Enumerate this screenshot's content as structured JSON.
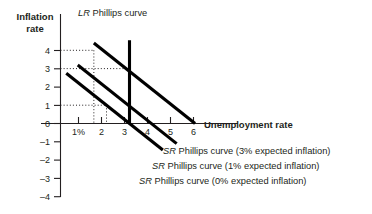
{
  "figure": {
    "y_axis_title": "Inflation rate",
    "y_axis_title_line1": "Inflation",
    "y_axis_title_line2": "rate",
    "x_axis_title": "Unemployment rate"
  },
  "labels": {
    "lr_prefix": "LR",
    "lr_text": " Phillips curve",
    "sr_prefix": "SR",
    "sr3_text": " Phillips curve (3% expected inflation)",
    "sr1_text": " Phillips curve (1% expected inflation)",
    "sr0_text": " Phillips curve (0% expected inflation)"
  },
  "chart_data": {
    "type": "line",
    "title": "",
    "xlabel": "Unemployment rate",
    "ylabel": "Inflation rate",
    "xlim": [
      0,
      7
    ],
    "ylim": [
      -4.6,
      4.6
    ],
    "grid": false,
    "legend_position": "inline-right",
    "x_ticks": [
      1,
      2,
      3,
      4,
      5,
      6
    ],
    "x_tick_labels": [
      "1%",
      "2",
      "3",
      "4",
      "5",
      "6"
    ],
    "y_ticks": [
      4,
      3,
      2,
      1,
      0,
      -1,
      -2,
      -3,
      -4
    ],
    "y_tick_labels": [
      "4",
      "3",
      "2",
      "1",
      "0",
      "-1",
      "-2",
      "-3",
      "-4"
    ],
    "series": [
      {
        "name": "LR Phillips curve",
        "type": "vertical-line",
        "x": 3,
        "y_from": 4.55,
        "y_to": 0
      },
      {
        "name": "SR Phillips curve (3% expected inflation)",
        "expected_inflation": 3,
        "slope": -1,
        "points": [
          [
            1.45,
            4.4
          ],
          [
            5.85,
            0.0
          ]
        ]
      },
      {
        "name": "SR Phillips curve (1% expected inflation)",
        "expected_inflation": 1,
        "slope": -1,
        "points": [
          [
            0.75,
            3.2
          ],
          [
            5.05,
            -1.1
          ]
        ]
      },
      {
        "name": "SR Phillips curve (0% expected inflation)",
        "expected_inflation": 0,
        "slope": -1,
        "points": [
          [
            0.25,
            2.75
          ],
          [
            4.45,
            -1.45
          ]
        ]
      }
    ],
    "guides": [
      {
        "from": [
          0,
          4
        ],
        "to": [
          1.45,
          4
        ],
        "style": "dotted"
      },
      {
        "from": [
          1.45,
          4
        ],
        "to": [
          1.45,
          0
        ],
        "style": "dotted"
      },
      {
        "from": [
          0,
          3
        ],
        "to": [
          3,
          3
        ],
        "style": "dotted"
      },
      {
        "from": [
          3,
          3
        ],
        "to": [
          3,
          0
        ],
        "style": "dotted"
      },
      {
        "from": [
          0,
          1
        ],
        "to": [
          2,
          1
        ],
        "style": "dotted"
      },
      {
        "from": [
          2,
          1
        ],
        "to": [
          2,
          0
        ],
        "style": "dotted"
      }
    ],
    "annotations": [
      {
        "text": "LR Phillips curve",
        "x": 3,
        "y": 4.6
      },
      {
        "text": "SR Phillips curve (3% expected inflation)",
        "x": 5.9,
        "y": -1.2
      },
      {
        "text": "SR Phillips curve (1% expected inflation)",
        "x": 5.2,
        "y": -1.9
      },
      {
        "text": "SR Phillips curve (0% expected inflation)",
        "x": 4.6,
        "y": -2.6
      }
    ]
  },
  "colors": {
    "ink": "#231f20",
    "curve": "#000000",
    "background": "#ffffff"
  }
}
